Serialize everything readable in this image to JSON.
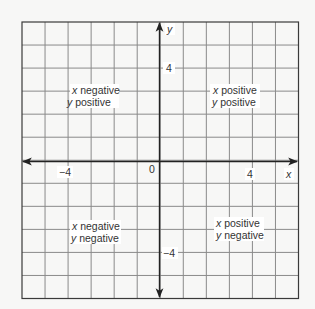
{
  "diagram": {
    "type": "coordinate-plane",
    "grid": {
      "x_min": -6,
      "x_max": 6,
      "y_min": -6,
      "y_max": 6,
      "step": 1
    },
    "colors": {
      "background": "#f7f7f6",
      "grid": "#8a8a8a",
      "border": "#3a3a3a",
      "axis": "#222222",
      "text": "#333333",
      "label_bg": "#ffffff"
    },
    "axes": {
      "x_label": "x",
      "y_label": "y",
      "origin_label": "0",
      "x_ticks": [
        {
          "value": -4,
          "label": "−4"
        },
        {
          "value": 4,
          "label": "4"
        }
      ],
      "y_ticks": [
        {
          "value": 4,
          "label": "4"
        },
        {
          "value": -4,
          "label": "−4"
        }
      ]
    },
    "quadrants": [
      {
        "id": "q2",
        "line1_var": "x",
        "line1_text": " negative",
        "line2_var": "y",
        "line2_text": " positive"
      },
      {
        "id": "q1",
        "line1_var": "x",
        "line1_text": " positive",
        "line2_var": "y",
        "line2_text": " positive"
      },
      {
        "id": "q3",
        "line1_var": "x",
        "line1_text": " negative",
        "line2_var": "y",
        "line2_text": " negative"
      },
      {
        "id": "q4",
        "line1_var": "x",
        "line1_text": " positive",
        "line2_var": "y",
        "line2_text": " negative"
      }
    ]
  }
}
